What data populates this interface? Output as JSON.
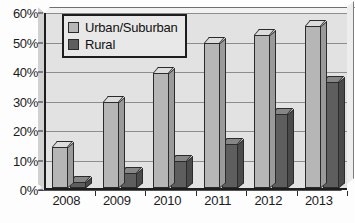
{
  "chart_data": {
    "type": "bar",
    "title": "",
    "subtitle": "",
    "xlabel": "",
    "ylabel": "",
    "categories": [
      "2008",
      "2009",
      "2010",
      "2011",
      "2012",
      "2013"
    ],
    "series": [
      {
        "name": "Urban/Suburban",
        "color": "#b6b6b6",
        "values": [
          14,
          29,
          39,
          49,
          52,
          55
        ]
      },
      {
        "name": "Rural",
        "color": "#5e5e5e",
        "values": [
          2,
          5,
          9,
          15,
          25,
          36
        ]
      }
    ],
    "ylim": [
      0,
      60
    ],
    "ytick_values": [
      0,
      10,
      20,
      30,
      40,
      50,
      60
    ],
    "ytick_labels": [
      "0%",
      "10%",
      "20%",
      "30%",
      "40%",
      "50%",
      "60%"
    ],
    "grid": true,
    "grid_axis": "y",
    "legend_position": "top-left",
    "style_3d": true,
    "plot_background": "#e2e2e2",
    "axis_color": "#1d1d1d",
    "gridline_color": "#8d8d8d"
  }
}
